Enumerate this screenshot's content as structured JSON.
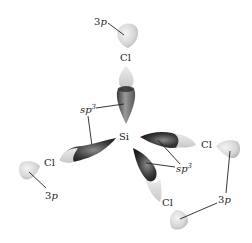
{
  "diagram": {
    "central_atom": {
      "label": "Si"
    },
    "ligands": [
      {
        "id": "top",
        "atom": "Cl",
        "orbital": "3p"
      },
      {
        "id": "left",
        "atom": "Cl",
        "orbital": "3p"
      },
      {
        "id": "right",
        "atom": "Cl",
        "orbital": "3p"
      },
      {
        "id": "bottom",
        "atom": "Cl",
        "orbital": "3p"
      }
    ],
    "hybrid_labels": [
      {
        "id": "sp3-left",
        "base": "sp",
        "sup": "3"
      },
      {
        "id": "sp3-right",
        "base": "sp",
        "sup": "3"
      }
    ],
    "orbital_labels": [
      {
        "id": "3p-top",
        "num": "3",
        "letter": "p"
      },
      {
        "id": "3p-left",
        "num": "3",
        "letter": "p"
      },
      {
        "id": "3p-right",
        "num": "3",
        "letter": "p"
      }
    ],
    "colors": {
      "lobe_light": "#e6e6e6",
      "lobe_dark": "#2a2a2a",
      "line": "#222222"
    }
  }
}
